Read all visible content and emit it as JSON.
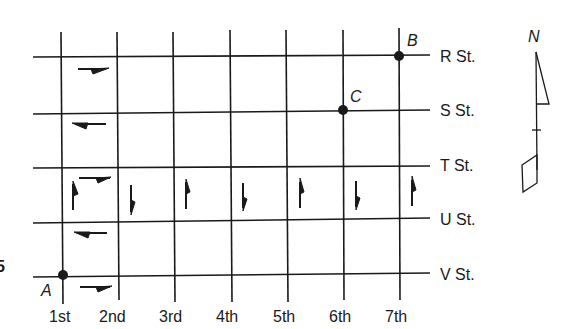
{
  "figure_number_fragment": "5",
  "avenues": [
    "1st",
    "2nd",
    "3rd",
    "4th",
    "5th",
    "6th",
    "7th"
  ],
  "streets": [
    "R St.",
    "S St.",
    "T St.",
    "U St.",
    "V St."
  ],
  "points": [
    {
      "label": "A",
      "avenue": "1st",
      "street": "V St."
    },
    {
      "label": "B",
      "avenue": "7th",
      "street": "R St."
    },
    {
      "label": "C",
      "avenue": "6th",
      "street": "S St."
    }
  ],
  "compass": {
    "label": "N"
  },
  "one_way_arrows": [
    {
      "location": "between R St. and S St. (block 1st-2nd)",
      "direction": "east"
    },
    {
      "location": "between S St. and T St. (block 1st-2nd)",
      "direction": "west"
    },
    {
      "location": "between T St. and U St. (block 1st-2nd, top)",
      "direction": "east"
    },
    {
      "location": "between U St. and V St. (block 1st-2nd)",
      "direction": "west"
    },
    {
      "location": "below V St. (block 1st-2nd)",
      "direction": "east"
    },
    {
      "location": "1st Ave, T-U",
      "direction": "north"
    },
    {
      "location": "2nd Ave, T-U",
      "direction": "south"
    },
    {
      "location": "3rd Ave, T-U",
      "direction": "north"
    },
    {
      "location": "4th Ave, T-U",
      "direction": "south"
    },
    {
      "location": "5th Ave, T-U",
      "direction": "north"
    },
    {
      "location": "6th Ave, T-U",
      "direction": "south"
    },
    {
      "location": "7th Ave, T-U",
      "direction": "north"
    }
  ]
}
